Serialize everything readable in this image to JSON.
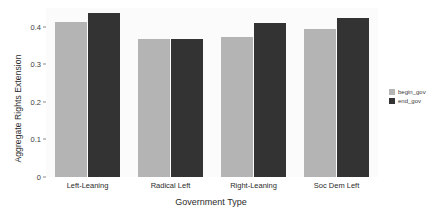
{
  "chart_data": {
    "type": "bar",
    "title": "",
    "xlabel": "Government Type",
    "ylabel": "Aggregate Rights Extension",
    "categories": [
      "Left-Leaning",
      "Radical Left",
      "Right-Leaning",
      "Soc Dem Left"
    ],
    "series": [
      {
        "name": "begin_gov",
        "color": "#b4b4b4",
        "values": [
          0.412,
          0.368,
          0.373,
          0.394
        ]
      },
      {
        "name": "end_gov",
        "color": "#333333",
        "values": [
          0.436,
          0.368,
          0.411,
          0.424
        ]
      }
    ],
    "ylim": [
      0,
      0.45
    ],
    "yticks": [
      0,
      0.1,
      0.2,
      0.3,
      0.4
    ],
    "ytick_labels": [
      "0",
      "0.1",
      "0.2",
      "0.3",
      "0.4"
    ],
    "grid": false,
    "legend_position": "right",
    "panel_background": "#fbfbfb"
  },
  "legend": {
    "entries": [
      {
        "label": "begin_gov"
      },
      {
        "label": "end_gov"
      }
    ]
  }
}
